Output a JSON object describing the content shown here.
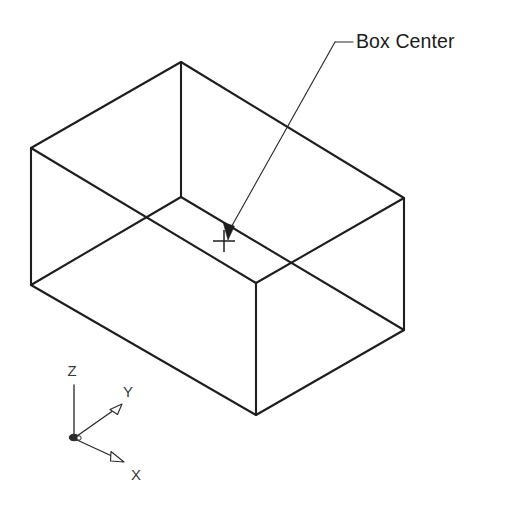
{
  "figure": {
    "title": "Box Center",
    "background_color": "#ffffff",
    "line_color": "#1e1e1e",
    "width": 518,
    "height": 506
  },
  "callout": {
    "label": "Box Center",
    "label_x": 356,
    "label_y": 48,
    "shoulder_start_x": 335,
    "shoulder_start_y": 42,
    "shoulder_end_x": 353,
    "shoulder_end_y": 42,
    "tip_x": 228,
    "tip_y": 234
  },
  "center_marker": {
    "name": "box-center-crosshair",
    "x": 224,
    "y": 241,
    "arm_length": 11
  },
  "box": {
    "type": "wireframe-rectangular-prism",
    "vertices": {
      "top_back": [
        181,
        62
      ],
      "top_left": [
        31,
        148
      ],
      "top_right": [
        404,
        198
      ],
      "top_front": [
        256,
        283
      ],
      "bottom_back": [
        181,
        197
      ],
      "bottom_left": [
        31,
        285
      ],
      "bottom_right": [
        404,
        330
      ],
      "bottom_front": [
        256,
        415
      ]
    }
  },
  "ucs_icon": {
    "name": "ucs-axis-indicator",
    "origin_x": 74,
    "origin_y": 437,
    "axes": [
      {
        "name": "z-axis",
        "label": "Z",
        "end_x": 74,
        "end_y": 385,
        "label_x": 72,
        "label_y": 376,
        "arrowhead": false
      },
      {
        "name": "y-axis",
        "label": "Y",
        "end_x": 118,
        "end_y": 408,
        "label_x": 128,
        "label_y": 397,
        "arrowhead": true
      },
      {
        "name": "x-axis",
        "label": "X",
        "end_x": 118,
        "end_y": 459,
        "label_x": 136,
        "label_y": 480,
        "arrowhead": true
      }
    ]
  }
}
